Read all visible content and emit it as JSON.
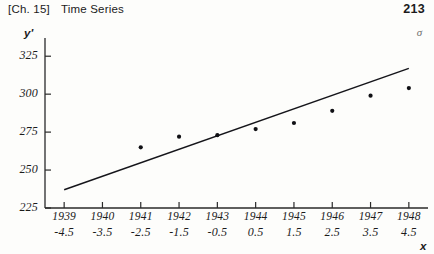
{
  "header": {
    "chapter": "[Ch. 15]",
    "title": "Time Series",
    "folio": "213",
    "margin_mark": "σ"
  },
  "chart_data": {
    "type": "scatter",
    "title": "",
    "xlabel": "x",
    "ylabel": "y'",
    "grid": false,
    "legend": "none",
    "ylim": [
      225,
      337
    ],
    "yticks": [
      225,
      250,
      275,
      300,
      325
    ],
    "ytick_labels": [
      "225",
      "250",
      "275",
      "300",
      "325"
    ],
    "xlim": [
      -5.0,
      5.0
    ],
    "xticks": [
      -4.5,
      -3.5,
      -2.5,
      -1.5,
      -0.5,
      0.5,
      1.5,
      2.5,
      3.5,
      4.5
    ],
    "xtick_labels": [
      "-4.5",
      "-3.5",
      "-2.5",
      "-1.5",
      "-0.5",
      "0.5",
      "1.5",
      "2.5",
      "3.5",
      "4.5"
    ],
    "xtick_years": [
      "1939",
      "1940",
      "1941",
      "1942",
      "1943",
      "1944",
      "1945",
      "1946",
      "1947",
      "1948"
    ],
    "x": [
      -2.5,
      -1.5,
      -0.5,
      0.5,
      1.5,
      2.5,
      3.5,
      4.5
    ],
    "values": [
      265,
      272,
      273,
      277,
      281,
      289,
      299,
      304
    ],
    "series": [
      {
        "name": "observed",
        "x": [
          -2.5,
          -1.5,
          -0.5,
          0.5,
          1.5,
          2.5,
          3.5,
          4.5
        ],
        "values": [
          265,
          272,
          273,
          277,
          281,
          289,
          299,
          304
        ]
      },
      {
        "name": "trend-line",
        "type": "line",
        "x": [
          -4.5,
          4.5
        ],
        "values": [
          237,
          317
        ]
      }
    ]
  }
}
